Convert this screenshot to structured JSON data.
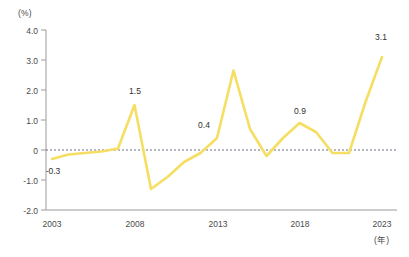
{
  "chart_data": {
    "type": "line",
    "title": "",
    "xlabel": "(年)",
    "ylabel": "(%)",
    "x": [
      2003,
      2004,
      2005,
      2006,
      2007,
      2008,
      2009,
      2010,
      2011,
      2012,
      2013,
      2014,
      2015,
      2016,
      2017,
      2018,
      2019,
      2020,
      2021,
      2022,
      2023
    ],
    "values": [
      -0.3,
      -0.15,
      -0.1,
      -0.05,
      0.05,
      1.5,
      -1.3,
      -0.9,
      -0.4,
      -0.1,
      0.4,
      2.65,
      0.7,
      -0.2,
      0.4,
      0.9,
      0.6,
      -0.1,
      -0.1,
      1.6,
      3.1
    ],
    "ylim": [
      -2.0,
      4.0
    ],
    "xlim": [
      2003,
      2023
    ],
    "grid": false,
    "zero_line": 0,
    "series": [
      {
        "name": "",
        "values": [
          -0.3,
          -0.15,
          -0.1,
          -0.05,
          0.05,
          1.5,
          -1.3,
          -0.9,
          -0.4,
          -0.1,
          0.4,
          2.65,
          0.7,
          -0.2,
          0.4,
          0.9,
          0.6,
          -0.1,
          -0.1,
          1.6,
          3.1
        ]
      }
    ],
    "y_ticks": [
      "4.0",
      "3.0",
      "2.0",
      "1.0",
      "0",
      "-1.0",
      "-2.0"
    ],
    "y_tick_values": [
      4.0,
      3.0,
      2.0,
      1.0,
      0,
      -1.0,
      -2.0
    ],
    "x_ticks": [
      "2003",
      "2008",
      "2013",
      "2018",
      "2023"
    ],
    "x_tick_values": [
      2003,
      2008,
      2013,
      2018,
      2023
    ],
    "annotations": [
      {
        "text": "-0.3",
        "x": 2003,
        "y": -0.3
      },
      {
        "text": "1.5",
        "x": 2008,
        "y": 1.5
      },
      {
        "text": "0.4",
        "x": 2013,
        "y": 0.4
      },
      {
        "text": "0.9",
        "x": 2018,
        "y": 0.9
      },
      {
        "text": "3.1",
        "x": 2023,
        "y": 3.1
      }
    ],
    "line_color": "#f5de62",
    "axis_color": "#9a9a9a",
    "zero_line_color": "#6d6d8a",
    "legend": []
  }
}
